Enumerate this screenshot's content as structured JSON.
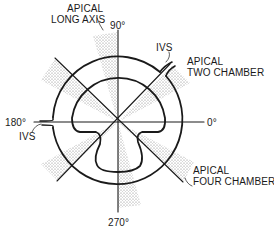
{
  "labels": {
    "apical_long_axis_line1": "APICAL",
    "apical_long_axis_line2": "LONG AXIS",
    "angle_90": "90°",
    "ivs_top": "IVS",
    "apical_two_chamber_line1": "APICAL",
    "apical_two_chamber_line2": "TWO CHAMBER",
    "angle_180": "180°",
    "ivs_left": "IVS",
    "angle_0": "0°",
    "apical_four_chamber_line1": "APICAL",
    "apical_four_chamber_line2": "FOUR CHAMBER",
    "angle_270": "270°"
  },
  "colors": {
    "line": "#1a1a1a",
    "stipple": "#8a8a8a",
    "background": "#ffffff"
  }
}
